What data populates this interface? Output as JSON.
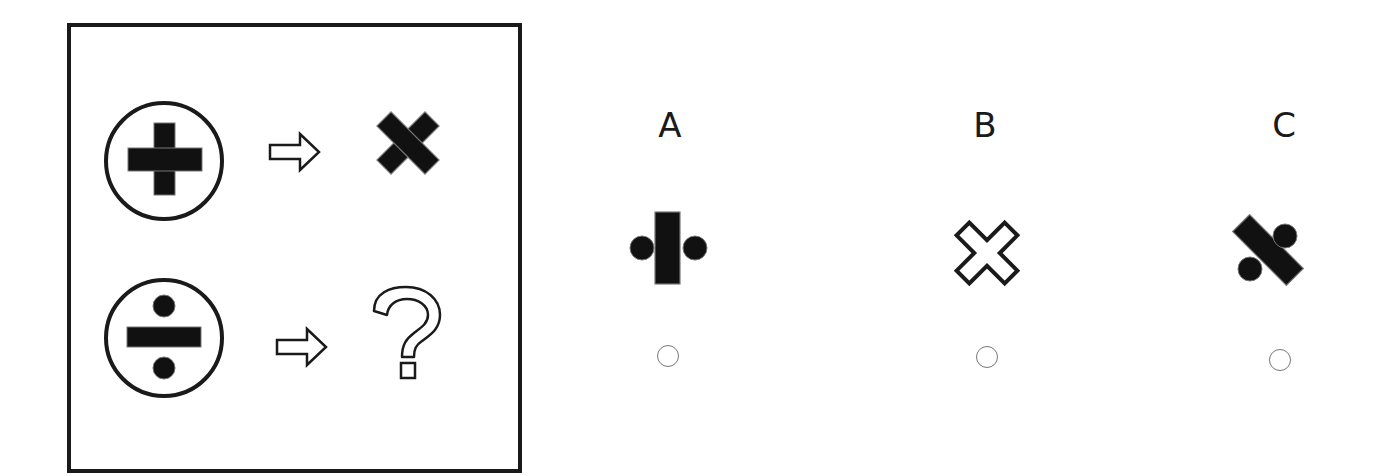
{
  "puzzle": {
    "question_box": {
      "rows": [
        {
          "input_symbol": "plus-in-circle",
          "arrow": "hollow-right-arrow",
          "output_symbol": "filled-multiply-x"
        },
        {
          "input_symbol": "divide-in-circle",
          "arrow": "hollow-right-arrow",
          "output_symbol": "question-mark"
        }
      ]
    },
    "options": [
      {
        "label": "A",
        "symbol": "divide-sign-rotated-90-vertical-bar-with-side-dots",
        "selected": false
      },
      {
        "label": "B",
        "symbol": "outlined-multiply-x",
        "selected": false
      },
      {
        "label": "C",
        "symbol": "divide-sign-rotated-45-diagonal-bar-with-dots",
        "selected": false
      }
    ]
  },
  "colors": {
    "ink": "#1a1a1a",
    "radio_border": "#777777",
    "background": "#ffffff"
  }
}
